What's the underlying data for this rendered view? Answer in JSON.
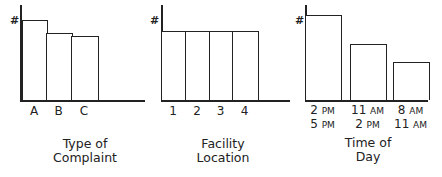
{
  "chart_data": [
    {
      "type": "bar",
      "title": "Type of Complaint",
      "title_lines": [
        "Type of",
        "Complaint"
      ],
      "ylabel": "#",
      "xlabel": "",
      "categories": [
        "A",
        "B",
        "C"
      ],
      "values": [
        80,
        67,
        64
      ],
      "grid": false,
      "legend": null
    },
    {
      "type": "bar",
      "title": "Facility Location",
      "title_lines": [
        "Facility",
        "Location"
      ],
      "ylabel": "#",
      "xlabel": "",
      "categories": [
        "1",
        "2",
        "3",
        "4"
      ],
      "values": [
        69,
        69,
        69,
        69
      ],
      "grid": false,
      "legend": null
    },
    {
      "type": "bar",
      "title": "Time of Day",
      "title_lines": [
        "Time of",
        "Day"
      ],
      "ylabel": "#",
      "xlabel": "",
      "categories": [
        "2 PM - 5 PM",
        "11 AM - 2 PM",
        "8 AM - 11 AM"
      ],
      "category_lines": [
        [
          {
            "num": "2",
            "ampm": "PM"
          },
          {
            "num": "5",
            "ampm": "PM"
          }
        ],
        [
          {
            "num": "11",
            "ampm": "AM"
          },
          {
            "num": "2",
            "ampm": "PM"
          }
        ],
        [
          {
            "num": "8",
            "ampm": "AM"
          },
          {
            "num": "11",
            "ampm": "AM"
          }
        ]
      ],
      "values": [
        85,
        56,
        38
      ],
      "grid": false,
      "legend": null
    }
  ]
}
